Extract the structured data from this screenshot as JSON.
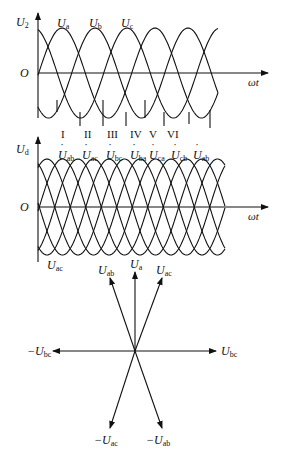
{
  "waveform_top": {
    "y_axis_label": "U",
    "y_axis_sub": "2",
    "origin_label": "O",
    "x_axis_label": "ωt",
    "curves": [
      {
        "label": "U",
        "sub": "a"
      },
      {
        "label": "U",
        "sub": "b"
      },
      {
        "label": "U",
        "sub": "c"
      }
    ]
  },
  "segments": [
    "I",
    "II",
    "III",
    "IV",
    "V",
    "VI"
  ],
  "conducting_phasors": [
    {
      "label": "U",
      "sub": "ab"
    },
    {
      "label": "U",
      "sub": "ac"
    },
    {
      "label": "U",
      "sub": "bc"
    },
    {
      "label": "U",
      "sub": "ba"
    },
    {
      "label": "U",
      "sub": "ca"
    },
    {
      "label": "U",
      "sub": "cb"
    },
    {
      "label": "U",
      "sub": "ab"
    }
  ],
  "waveform_bottom": {
    "y_axis_label": "U",
    "y_axis_sub": "d",
    "origin_label": "O",
    "x_axis_label": "ωt",
    "corner_label": {
      "label": "U",
      "sub": "ac"
    }
  },
  "phasor_diagram": {
    "vectors": [
      {
        "label": "U",
        "sub": "a",
        "prefix": ""
      },
      {
        "label": "U",
        "sub": "ab",
        "prefix": ""
      },
      {
        "label": "U",
        "sub": "ac",
        "prefix": ""
      },
      {
        "label": "U",
        "sub": "bc",
        "prefix": ""
      },
      {
        "label": "U",
        "sub": "bc",
        "prefix": "−"
      },
      {
        "label": "U",
        "sub": "ac",
        "prefix": "−"
      },
      {
        "label": "U",
        "sub": "ab",
        "prefix": "−"
      }
    ]
  }
}
